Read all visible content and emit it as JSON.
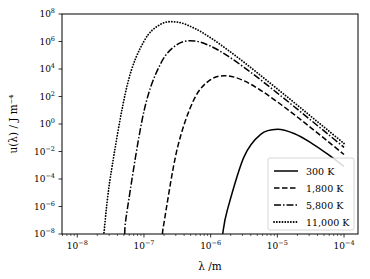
{
  "chart_data": {
    "type": "line",
    "title": "",
    "xlabel": "λ /m",
    "ylabel": "u(λ) / J m⁻⁴",
    "xscale": "log",
    "yscale": "log",
    "xlim": [
      5.9e-09,
      0.000162
    ],
    "ylim": [
      1e-08,
      100000000.0
    ],
    "grid": false,
    "legend_position": "lower-right",
    "x_ticks": [
      {
        "value": 1e-08,
        "base": "10",
        "exp": "−8"
      },
      {
        "value": 1e-07,
        "base": "10",
        "exp": "−7"
      },
      {
        "value": 1e-06,
        "base": "10",
        "exp": "−6"
      },
      {
        "value": 1e-05,
        "base": "10",
        "exp": "−5"
      },
      {
        "value": 0.0001,
        "base": "10",
        "exp": "−4"
      }
    ],
    "y_ticks": [
      {
        "value": 100000000.0,
        "base": "10",
        "exp": "8"
      },
      {
        "value": 1000000.0,
        "base": "10",
        "exp": "6"
      },
      {
        "value": 10000.0,
        "base": "10",
        "exp": "4"
      },
      {
        "value": 100.0,
        "base": "10",
        "exp": "2"
      },
      {
        "value": 1.0,
        "base": "10",
        "exp": "0"
      },
      {
        "value": 0.01,
        "base": "10",
        "exp": "−2"
      },
      {
        "value": 0.0001,
        "base": "10",
        "exp": "−4"
      },
      {
        "value": 1e-06,
        "base": "10",
        "exp": "−6"
      },
      {
        "value": 1e-08,
        "base": "10",
        "exp": "−8"
      }
    ],
    "series": [
      {
        "name": "300 K",
        "temperature_K": 300,
        "style": "solid",
        "log10_x": [
          -5.82,
          -5.75,
          -5.5,
          -5.25,
          -5.0,
          -4.75,
          -4.5,
          -4.25,
          -4.0
        ],
        "log10_y": [
          -8.0,
          -6.26,
          -2.39,
          -0.75,
          -0.38,
          -0.69,
          -1.35,
          -2.18,
          -3.09
        ]
      },
      {
        "name": "1,800 K",
        "temperature_K": 1800,
        "style": "dashed",
        "log10_x": [
          -6.72,
          -6.7,
          -6.5,
          -6.25,
          -6.0,
          -5.75,
          -5.5,
          -5.25,
          -5.0,
          -4.75,
          -4.5,
          -4.25,
          -4.0
        ],
        "log10_y": [
          -8.0,
          -7.2,
          -1.78,
          1.78,
          3.23,
          3.5,
          3.14,
          2.45,
          1.61,
          0.7,
          -0.26,
          -1.23,
          -2.22
        ]
      },
      {
        "name": "5,800 K",
        "temperature_K": 5800,
        "style": "dashdot",
        "log10_x": [
          -7.29,
          -7.25,
          -7.0,
          -6.75,
          -6.5,
          -6.25,
          -6.0,
          -5.75,
          -5.5,
          -5.25,
          -5.0,
          -4.75,
          -4.5,
          -4.25,
          -4.0
        ],
        "log10_y": [
          -8.0,
          -6.21,
          0.93,
          4.39,
          5.79,
          6.04,
          5.66,
          4.97,
          4.12,
          3.21,
          2.25,
          1.275,
          0.288,
          -0.704,
          -1.7
        ]
      },
      {
        "name": "11,000 K",
        "temperature_K": 11000,
        "style": "dotted",
        "log10_x": [
          -7.6,
          -7.5,
          -7.25,
          -7.0,
          -6.75,
          -6.5,
          -6.25,
          -6.0,
          -5.75,
          -5.5,
          -5.25,
          -5.0,
          -4.75,
          -4.5,
          -4.25,
          -4.0
        ],
        "log10_y": [
          -7.91,
          -3.76,
          2.85,
          6.02,
          7.256,
          7.41,
          6.98,
          6.27,
          5.41,
          4.49,
          3.53,
          2.55,
          1.57,
          0.57,
          -0.42,
          -1.42
        ]
      }
    ]
  }
}
